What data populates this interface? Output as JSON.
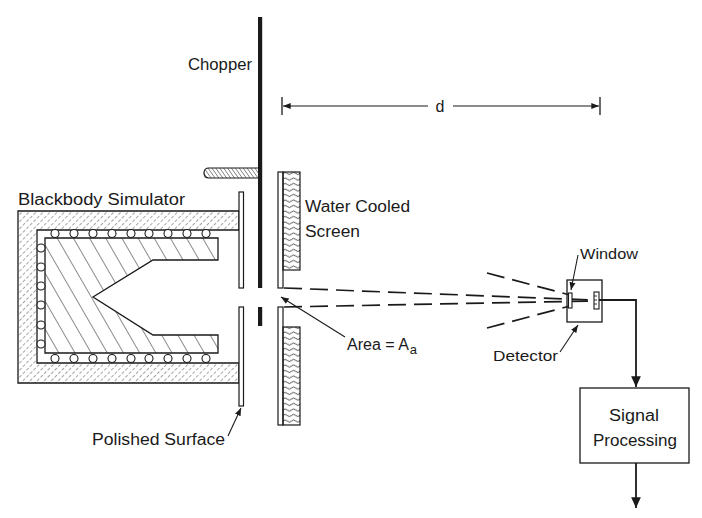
{
  "figure": {
    "type": "schematic",
    "ink_color": "#1a1a1a",
    "background": "#ffffff",
    "labels": {
      "chopper": "Chopper",
      "distance": "d",
      "blackbody": "Blackbody Simulator",
      "water_cooled_line1": "Water Cooled",
      "water_cooled_line2": "Screen",
      "area_main": "Area = A",
      "area_subscript": "a",
      "window": "Window",
      "detector": "Detector",
      "polished_surface": "Polished Surface",
      "signal_line1": "Signal",
      "signal_line2": "Processing"
    },
    "components": [
      "blackbody-simulator",
      "polished-surface",
      "chopper",
      "water-cooled-screen",
      "aperture",
      "detector",
      "window",
      "signal-processing"
    ]
  }
}
